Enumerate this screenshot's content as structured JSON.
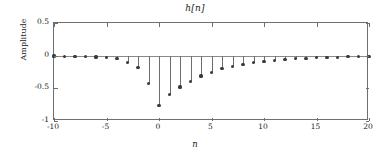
{
  "chart_data": {
    "type": "stem",
    "title": "h[n]",
    "xlabel": "n",
    "ylabel": "Amplitude",
    "xlim": [
      -10,
      20
    ],
    "ylim": [
      -1,
      0.5
    ],
    "grid": false,
    "legend": null,
    "xticks": [
      -10,
      -5,
      0,
      5,
      10,
      15,
      20
    ],
    "xticklabels": [
      "-10",
      "-5",
      "0",
      "5",
      "10",
      "15",
      "20"
    ],
    "yticks": [
      0.5,
      0,
      -0.5,
      -1
    ],
    "yticklabels": [
      "0.5",
      "0",
      "-0.5",
      "-1"
    ],
    "marker": "filled-circle",
    "stem_color": "#6d6d6d",
    "marker_color": "#3a3a3a",
    "x": [
      -10,
      -9,
      -8,
      -7,
      -6,
      -5,
      -4,
      -3,
      -2,
      -1,
      0,
      1,
      2,
      3,
      4,
      5,
      6,
      7,
      8,
      9,
      10,
      11,
      12,
      13,
      14,
      15,
      16,
      17,
      18,
      19,
      20
    ],
    "values": [
      -0.005,
      -0.008,
      -0.01,
      -0.014,
      -0.02,
      -0.028,
      -0.048,
      -0.11,
      -0.175,
      -0.43,
      -0.76,
      -0.6,
      -0.48,
      -0.39,
      -0.31,
      -0.26,
      -0.2,
      -0.16,
      -0.13,
      -0.105,
      -0.085,
      -0.07,
      -0.058,
      -0.048,
      -0.04,
      -0.033,
      -0.027,
      -0.022,
      -0.018,
      -0.014,
      -0.01
    ]
  }
}
